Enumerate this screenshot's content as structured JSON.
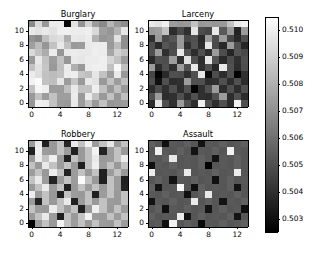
{
  "figure": {
    "width": 313,
    "height": 255,
    "background": "#ffffff",
    "colormap": "gray",
    "layout": "2x2 grid of heatmaps with one shared vertical colorbar on the right"
  },
  "chart_data": {
    "type": "heatmap",
    "title": "",
    "subtitle": "",
    "xlabel": "",
    "ylabel": "",
    "grid": false,
    "legend_position": "right",
    "colorbar": {
      "orientation": "vertical",
      "colormap": "gray",
      "vmin": 0.5025,
      "vmax": 0.5105,
      "ticks": [
        0.503,
        0.504,
        0.505,
        0.506,
        0.507,
        0.508,
        0.509,
        0.51
      ],
      "tick_labels": [
        "0.503",
        "0.504",
        "0.505",
        "0.506",
        "0.507",
        "0.508",
        "0.509",
        "0.510"
      ],
      "low_color": "#000000",
      "high_color": "#ffffff"
    },
    "shared_axes": {
      "x_ticks": [
        0,
        4,
        8,
        12
      ],
      "x_tick_labels": [
        "0",
        "4",
        "8",
        "12"
      ],
      "y_ticks": [
        0,
        2,
        4,
        6,
        8,
        10
      ],
      "y_tick_labels": [
        "0",
        "2",
        "4",
        "6",
        "8",
        "10"
      ],
      "xlim": [
        -0.5,
        13.5
      ],
      "ylim": [
        -0.5,
        11.5
      ],
      "n_cols": 14,
      "n_rows": 12
    },
    "panels": [
      {
        "title": "Burglary",
        "position": "top-left",
        "values": [
          [
            0.5068,
            0.5093,
            0.5073,
            0.5099,
            0.5099,
            0.5027,
            0.5096,
            0.5071,
            0.5091,
            0.5074,
            0.5068,
            0.5082,
            0.5073,
            0.5069
          ],
          [
            0.5098,
            0.5096,
            0.5098,
            0.5096,
            0.51,
            0.51,
            0.5099,
            0.5099,
            0.51,
            0.5093,
            0.5075,
            0.5072,
            0.5081,
            0.5097
          ],
          [
            0.5071,
            0.5068,
            0.5085,
            0.5093,
            0.5095,
            0.508,
            0.5098,
            0.5097,
            0.5099,
            0.5081,
            0.5072,
            0.5074,
            0.5096,
            0.507
          ],
          [
            0.5075,
            0.5084,
            0.5072,
            0.5086,
            0.5098,
            0.5086,
            0.5073,
            0.5074,
            0.5098,
            0.5099,
            0.5099,
            0.5073,
            0.5084,
            0.507
          ],
          [
            0.5093,
            0.5086,
            0.5079,
            0.5099,
            0.5072,
            0.5098,
            0.5099,
            0.5098,
            0.5098,
            0.51,
            0.5099,
            0.5077,
            0.5091,
            0.5086
          ],
          [
            0.5073,
            0.5098,
            0.5086,
            0.5074,
            0.5086,
            0.5072,
            0.5098,
            0.5097,
            0.5099,
            0.5099,
            0.51,
            0.5092,
            0.5086,
            0.5074
          ],
          [
            0.5086,
            0.5096,
            0.5087,
            0.5073,
            0.5085,
            0.5099,
            0.508,
            0.5073,
            0.5099,
            0.51,
            0.51,
            0.5086,
            0.5103,
            0.5085
          ],
          [
            0.5099,
            0.5095,
            0.5086,
            0.5084,
            0.5086,
            0.5099,
            0.51,
            0.5087,
            0.5085,
            0.5097,
            0.5086,
            0.5074,
            0.5098,
            0.5073
          ],
          [
            0.5101,
            0.5104,
            0.5086,
            0.5085,
            0.5097,
            0.5074,
            0.5087,
            0.5073,
            0.5098,
            0.5096,
            0.5073,
            0.5086,
            0.5074,
            0.5085
          ],
          [
            0.5086,
            0.5102,
            0.51,
            0.5074,
            0.5074,
            0.5085,
            0.5098,
            0.5086,
            0.5086,
            0.51,
            0.5086,
            0.5073,
            0.5085,
            0.5073
          ],
          [
            0.5073,
            0.5086,
            0.5074,
            0.5086,
            0.5075,
            0.5075,
            0.5099,
            0.5073,
            0.5099,
            0.5086,
            0.5073,
            0.5086,
            0.5072,
            0.5085
          ],
          [
            0.5072,
            0.51,
            0.5099,
            0.5086,
            0.5074,
            0.5073,
            0.5098,
            0.5074,
            0.5086,
            0.5073,
            0.5086,
            0.5072,
            0.5073,
            0.5074
          ]
        ]
      },
      {
        "title": "Larceny",
        "position": "top-right",
        "values": [
          [
            0.5098,
            0.5096,
            0.51,
            0.5074,
            0.5072,
            0.5073,
            0.5086,
            0.5073,
            0.5074,
            0.5072,
            0.5073,
            0.5086,
            0.5098,
            0.5101
          ],
          [
            0.5073,
            0.5075,
            0.5086,
            0.5039,
            0.5048,
            0.504,
            0.5097,
            0.5049,
            0.5047,
            0.5098,
            0.5053,
            0.5073,
            0.5036,
            0.5074
          ],
          [
            0.504,
            0.5073,
            0.5048,
            0.5052,
            0.5073,
            0.5048,
            0.505,
            0.5038,
            0.5074,
            0.5049,
            0.5074,
            0.5047,
            0.5038,
            0.505
          ],
          [
            0.5049,
            0.5038,
            0.5052,
            0.5048,
            0.5073,
            0.504,
            0.5051,
            0.5039,
            0.5097,
            0.5048,
            0.5038,
            0.5074,
            0.505,
            0.5037
          ],
          [
            0.505,
            0.5074,
            0.504,
            0.5049,
            0.5098,
            0.5051,
            0.5039,
            0.505,
            0.504,
            0.5074,
            0.5049,
            0.5037,
            0.5051,
            0.5048
          ],
          [
            0.5038,
            0.505,
            0.5049,
            0.5074,
            0.504,
            0.5096,
            0.505,
            0.5039,
            0.5097,
            0.5051,
            0.5038,
            0.5049,
            0.504,
            0.505
          ],
          [
            0.5074,
            0.5039,
            0.505,
            0.504,
            0.5074,
            0.505,
            0.5098,
            0.504,
            0.505,
            0.5037,
            0.5098,
            0.505,
            0.5039,
            0.5049
          ],
          [
            0.5047,
            0.5026,
            0.5038,
            0.505,
            0.5049,
            0.504,
            0.505,
            0.5097,
            0.5028,
            0.5049,
            0.5039,
            0.505,
            0.5026,
            0.504
          ],
          [
            0.505,
            0.503,
            0.505,
            0.5039,
            0.504,
            0.5074,
            0.505,
            0.505,
            0.5039,
            0.504,
            0.505,
            0.5039,
            0.505,
            0.5039
          ],
          [
            0.5039,
            0.5049,
            0.504,
            0.505,
            0.5039,
            0.505,
            0.5026,
            0.504,
            0.505,
            0.5074,
            0.5039,
            0.505,
            0.5039,
            0.505
          ],
          [
            0.505,
            0.5074,
            0.5039,
            0.504,
            0.505,
            0.5039,
            0.505,
            0.504,
            0.5039,
            0.505,
            0.5074,
            0.5039,
            0.505,
            0.5039
          ],
          [
            0.5039,
            0.5097,
            0.505,
            0.504,
            0.5074,
            0.505,
            0.5039,
            0.51,
            0.505,
            0.5039,
            0.505,
            0.5039,
            0.5101,
            0.505
          ]
        ]
      },
      {
        "title": "Robbery",
        "position": "bottom-left",
        "values": [
          [
            0.5074,
            0.5098,
            0.5035,
            0.5073,
            0.5086,
            0.5037,
            0.5098,
            0.5086,
            0.5101,
            0.5074,
            0.5086,
            0.5097,
            0.5073,
            0.5086
          ],
          [
            0.5035,
            0.51,
            0.5074,
            0.5073,
            0.5086,
            0.5074,
            0.5035,
            0.5073,
            0.5086,
            0.5101,
            0.5036,
            0.5074,
            0.5086,
            0.5073
          ],
          [
            0.5073,
            0.5099,
            0.5086,
            0.51,
            0.5074,
            0.5035,
            0.5086,
            0.5073,
            0.5086,
            0.5098,
            0.5073,
            0.5074,
            0.5086,
            0.5099
          ],
          [
            0.5086,
            0.5073,
            0.5098,
            0.5086,
            0.5074,
            0.5086,
            0.5073,
            0.5035,
            0.5086,
            0.51,
            0.5074,
            0.5086,
            0.5073,
            0.5086
          ],
          [
            0.5074,
            0.5086,
            0.5073,
            0.5099,
            0.5086,
            0.5036,
            0.5074,
            0.5086,
            0.5073,
            0.5086,
            0.5035,
            0.5074,
            0.5086,
            0.5073
          ],
          [
            0.5086,
            0.5098,
            0.5074,
            0.5036,
            0.5073,
            0.5086,
            0.5074,
            0.5104,
            0.5086,
            0.5073,
            0.5035,
            0.5086,
            0.5074,
            0.5035
          ],
          [
            0.5073,
            0.5086,
            0.5099,
            0.5074,
            0.5086,
            0.5035,
            0.5073,
            0.5086,
            0.5074,
            0.5086,
            0.5073,
            0.5086,
            0.5074,
            0.5036
          ],
          [
            0.51,
            0.5074,
            0.5086,
            0.5073,
            0.5035,
            0.5086,
            0.5074,
            0.5073,
            0.5086,
            0.5035,
            0.5074,
            0.5086,
            0.5073,
            0.5086
          ],
          [
            0.5074,
            0.5036,
            0.5086,
            0.5073,
            0.5086,
            0.5098,
            0.5035,
            0.5074,
            0.5086,
            0.5073,
            0.5086,
            0.5074,
            0.5073,
            0.5086
          ],
          [
            0.5086,
            0.5074,
            0.5073,
            0.5099,
            0.5086,
            0.5074,
            0.5086,
            0.5035,
            0.5073,
            0.51,
            0.5086,
            0.5073,
            0.5086,
            0.5074
          ],
          [
            0.5073,
            0.5086,
            0.5098,
            0.5074,
            0.5035,
            0.5086,
            0.5073,
            0.5086,
            0.5101,
            0.5074,
            0.5073,
            0.5086,
            0.5074,
            0.5086
          ],
          [
            0.5024,
            0.5074,
            0.5086,
            0.5073,
            0.5101,
            0.5086,
            0.5074,
            0.5086,
            0.5073,
            0.5086,
            0.5074,
            0.5073,
            0.5086,
            0.5074
          ]
        ]
      },
      {
        "title": "Assault",
        "position": "bottom-right",
        "values": [
          [
            0.5055,
            0.5052,
            0.503,
            0.5053,
            0.5052,
            0.5055,
            0.5052,
            0.5031,
            0.5053,
            0.5052,
            0.5055,
            0.5052,
            0.5053,
            0.5055
          ],
          [
            0.5052,
            0.51,
            0.5053,
            0.5052,
            0.5055,
            0.5052,
            0.5031,
            0.5053,
            0.5052,
            0.5055,
            0.5052,
            0.5101,
            0.5053,
            0.5052
          ],
          [
            0.5053,
            0.5052,
            0.5055,
            0.5098,
            0.5052,
            0.5053,
            0.5052,
            0.5055,
            0.5052,
            0.5031,
            0.5053,
            0.5052,
            0.5055,
            0.5052
          ],
          [
            0.503,
            0.5053,
            0.5052,
            0.5055,
            0.5052,
            0.5053,
            0.5052,
            0.5055,
            0.5024,
            0.5052,
            0.5053,
            0.5052,
            0.5055,
            0.5052
          ],
          [
            0.5099,
            0.5052,
            0.5053,
            0.5052,
            0.5055,
            0.5098,
            0.5052,
            0.5053,
            0.5052,
            0.5055,
            0.5052,
            0.5053,
            0.5099,
            0.5052
          ],
          [
            0.5052,
            0.5055,
            0.5052,
            0.5031,
            0.5053,
            0.5052,
            0.5055,
            0.5052,
            0.5053,
            0.503,
            0.5052,
            0.5055,
            0.5052,
            0.5053
          ],
          [
            0.5055,
            0.5031,
            0.5052,
            0.5053,
            0.5103,
            0.5052,
            0.503,
            0.5055,
            0.5052,
            0.5053,
            0.5052,
            0.5055,
            0.5031,
            0.5052
          ],
          [
            0.5053,
            0.5052,
            0.5055,
            0.5052,
            0.5053,
            0.503,
            0.5052,
            0.5055,
            0.5098,
            0.5052,
            0.5053,
            0.5052,
            0.5055,
            0.5052
          ],
          [
            0.5031,
            0.5053,
            0.5052,
            0.5055,
            0.5052,
            0.5053,
            0.5099,
            0.5052,
            0.5055,
            0.5052,
            0.5031,
            0.5053,
            0.5052,
            0.5055
          ],
          [
            0.5052,
            0.5055,
            0.503,
            0.5053,
            0.5052,
            0.5055,
            0.5052,
            0.5053,
            0.5031,
            0.5052,
            0.5055,
            0.5052,
            0.5053,
            0.503
          ],
          [
            0.5055,
            0.5052,
            0.5053,
            0.5052,
            0.5099,
            0.5031,
            0.5052,
            0.5055,
            0.5052,
            0.5053,
            0.5052,
            0.5055,
            0.5031,
            0.5052
          ],
          [
            0.5052,
            0.5053,
            0.503,
            0.5101,
            0.5052,
            0.5055,
            0.5052,
            0.5028,
            0.5053,
            0.5052,
            0.5055,
            0.5052,
            0.5053,
            0.5055
          ]
        ]
      }
    ]
  }
}
